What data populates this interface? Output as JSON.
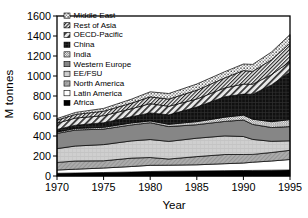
{
  "figure": {
    "background": "#ffffff",
    "frame_color": "#000000",
    "y_axis": {
      "title": "M tonnes",
      "min": 0,
      "max": 1600,
      "ticks": [
        0,
        200,
        400,
        600,
        800,
        1000,
        1200,
        1400,
        1600
      ]
    },
    "x_axis": {
      "title": "Year",
      "min": 1970,
      "max": 1995,
      "ticks": [
        1970,
        1975,
        1980,
        1985,
        1990,
        1995
      ]
    }
  },
  "chart_data": {
    "type": "area",
    "stacked": true,
    "title": "",
    "xlabel": "Year",
    "ylabel": "M tonnes",
    "ylim": [
      0,
      1600
    ],
    "grid": false,
    "legend_position": "top-left-inside",
    "legend_order": "top of stack first",
    "x": [
      1970,
      1972,
      1975,
      1978,
      1980,
      1982,
      1985,
      1988,
      1990,
      1991,
      1993,
      1995
    ],
    "series": [
      {
        "name": "Africa",
        "texture": "solid-black",
        "values": [
          27,
          30,
          35,
          40,
          45,
          48,
          50,
          53,
          55,
          56,
          58,
          60
        ]
      },
      {
        "name": "Latin America",
        "texture": "white",
        "values": [
          33,
          38,
          45,
          55,
          62,
          60,
          62,
          70,
          75,
          82,
          92,
          105
        ]
      },
      {
        "name": "North America",
        "texture": "gray-hatch",
        "values": [
          76,
          82,
          72,
          84,
          78,
          62,
          82,
          92,
          85,
          78,
          85,
          92
        ]
      },
      {
        "name": "EE/FSU",
        "texture": "light-gray-grid",
        "values": [
          138,
          150,
          162,
          172,
          180,
          176,
          184,
          186,
          180,
          150,
          112,
          95
        ]
      },
      {
        "name": "Western Europe",
        "texture": "solid-dark-gray",
        "values": [
          152,
          160,
          155,
          160,
          168,
          148,
          135,
          145,
          165,
          150,
          138,
          142
        ]
      },
      {
        "name": "India",
        "texture": "speckle-dots",
        "values": [
          14,
          16,
          18,
          20,
          18,
          23,
          31,
          42,
          49,
          52,
          58,
          70
        ]
      },
      {
        "name": "China",
        "texture": "black-crosshatch",
        "values": [
          26,
          32,
          46,
          62,
          80,
          95,
          146,
          205,
          210,
          250,
          368,
          476
        ]
      },
      {
        "name": "OECD-Pacific",
        "texture": "diagonal-wide",
        "values": [
          62,
          72,
          70,
          80,
          93,
          85,
          80,
          88,
          100,
          100,
          102,
          105
        ]
      },
      {
        "name": "Rest of Asia",
        "texture": "diagonal-fine",
        "values": [
          30,
          36,
          45,
          56,
          68,
          72,
          88,
          100,
          135,
          128,
          148,
          182
        ]
      },
      {
        "name": "Middle East",
        "texture": "dots-coarse",
        "values": [
          16,
          20,
          28,
          40,
          50,
          56,
          62,
          62,
          66,
          70,
          78,
          88
        ]
      }
    ]
  }
}
